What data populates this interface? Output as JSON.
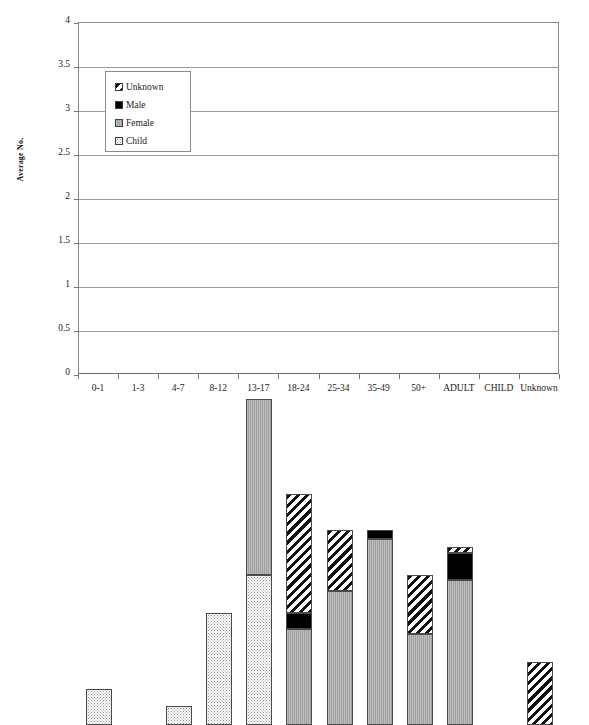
{
  "chart_data": {
    "type": "bar",
    "stacked": true,
    "title": "",
    "xlabel": "",
    "ylabel": "Average No.",
    "ylim": [
      0,
      4
    ],
    "ytick_step": 0.5,
    "ytick_labels": [
      "4",
      "3.5",
      "3",
      "2.5",
      "2",
      "1.5",
      "1",
      "0.5",
      "0"
    ],
    "ytick_values": [
      4,
      3.5,
      3,
      2.5,
      2,
      1.5,
      1,
      0.5,
      0
    ],
    "grid": "horizontal",
    "legend_position": "upper-left-inside",
    "categories": [
      "0-1",
      "1-3",
      "4-7",
      "8-12",
      "13-17",
      "18-24",
      "25-34",
      "35-49",
      "50+",
      "ADULT",
      "CHILD",
      "Unknown"
    ],
    "series": [
      {
        "name": "Child",
        "fill": "child",
        "values": [
          0.41,
          0,
          0.22,
          1.27,
          1.7,
          0,
          0,
          0,
          0,
          0,
          0,
          0
        ]
      },
      {
        "name": "Female",
        "fill": "female",
        "values": [
          0,
          0,
          0,
          0,
          2.01,
          1.09,
          1.52,
          2.11,
          1.03,
          1.65,
          0,
          0
        ]
      },
      {
        "name": "Male",
        "fill": "male",
        "values": [
          0,
          0,
          0,
          0,
          0,
          0.18,
          0,
          0.11,
          0,
          0.31,
          0,
          0
        ]
      },
      {
        "name": "Unknown",
        "fill": "unknown",
        "values": [
          0,
          0,
          0,
          0,
          0,
          1.36,
          0.7,
          0,
          0.68,
          0.06,
          0,
          0.72
        ]
      }
    ],
    "totals": [
      0.41,
      0,
      0.22,
      1.27,
      3.71,
      2.63,
      2.22,
      2.22,
      1.71,
      2.02,
      0,
      0.72
    ]
  },
  "legend": {
    "items": [
      {
        "label": "Unknown",
        "fill": "unknown"
      },
      {
        "label": "Male",
        "fill": "male"
      },
      {
        "label": "Female",
        "fill": "female"
      },
      {
        "label": "Child",
        "fill": "child"
      }
    ]
  },
  "colors": {
    "female": "#a9a9a9",
    "male": "#000000",
    "unknown": "#111111",
    "child": "#8d8d8d",
    "axis": "#6d6d6d",
    "grid": "#9a9a9a"
  }
}
